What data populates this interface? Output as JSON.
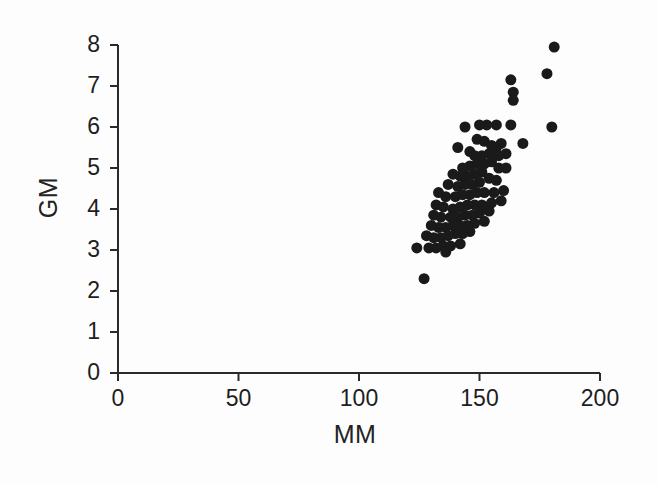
{
  "chart_data": {
    "type": "scatter",
    "title": "",
    "xlabel": "MM",
    "ylabel": "GM",
    "xlim": [
      0,
      200
    ],
    "ylim": [
      0,
      8
    ],
    "xticks": [
      0,
      50,
      100,
      150,
      200
    ],
    "yticks": [
      0,
      1,
      2,
      3,
      4,
      5,
      6,
      7,
      8
    ],
    "xtick_labels": [
      "0",
      "50",
      "100",
      "150",
      "200"
    ],
    "ytick_labels": [
      "0",
      "1",
      "2",
      "3",
      "4",
      "5",
      "6",
      "7",
      "8"
    ],
    "grid": false,
    "legend": null,
    "marker": "filled-circle",
    "marker_color": "#1a1a1a",
    "marker_size_px": 11,
    "n_points": 92,
    "points": [
      [
        181,
        7.95
      ],
      [
        178,
        7.3
      ],
      [
        163,
        7.15
      ],
      [
        164,
        6.85
      ],
      [
        164,
        6.65
      ],
      [
        180,
        6.0
      ],
      [
        163,
        6.05
      ],
      [
        157,
        6.05
      ],
      [
        153,
        6.05
      ],
      [
        150,
        6.05
      ],
      [
        144,
        6.0
      ],
      [
        168,
        5.6
      ],
      [
        159,
        5.6
      ],
      [
        149,
        5.7
      ],
      [
        152,
        5.65
      ],
      [
        155,
        5.55
      ],
      [
        157,
        5.5
      ],
      [
        161,
        5.35
      ],
      [
        158,
        5.3
      ],
      [
        154,
        5.35
      ],
      [
        151,
        5.3
      ],
      [
        148,
        5.3
      ],
      [
        146,
        5.4
      ],
      [
        141,
        5.5
      ],
      [
        155,
        5.15
      ],
      [
        152,
        5.1
      ],
      [
        149,
        5.1
      ],
      [
        146,
        5.05
      ],
      [
        143,
        5.0
      ],
      [
        158,
        5.0
      ],
      [
        161,
        5.0
      ],
      [
        151,
        4.9
      ],
      [
        148,
        4.85
      ],
      [
        145,
        4.8
      ],
      [
        142,
        4.8
      ],
      [
        139,
        4.85
      ],
      [
        154,
        4.75
      ],
      [
        157,
        4.7
      ],
      [
        150,
        4.65
      ],
      [
        147,
        4.6
      ],
      [
        144,
        4.6
      ],
      [
        141,
        4.55
      ],
      [
        137,
        4.6
      ],
      [
        160,
        4.45
      ],
      [
        156,
        4.4
      ],
      [
        152,
        4.4
      ],
      [
        149,
        4.4
      ],
      [
        146,
        4.35
      ],
      [
        143,
        4.35
      ],
      [
        140,
        4.3
      ],
      [
        136,
        4.3
      ],
      [
        133,
        4.4
      ],
      [
        159,
        4.2
      ],
      [
        155,
        4.15
      ],
      [
        151,
        4.1
      ],
      [
        148,
        4.1
      ],
      [
        145,
        4.1
      ],
      [
        142,
        4.05
      ],
      [
        139,
        4.0
      ],
      [
        135,
        4.05
      ],
      [
        132,
        4.1
      ],
      [
        154,
        3.95
      ],
      [
        150,
        3.9
      ],
      [
        147,
        3.85
      ],
      [
        144,
        3.85
      ],
      [
        141,
        3.8
      ],
      [
        138,
        3.8
      ],
      [
        134,
        3.8
      ],
      [
        131,
        3.85
      ],
      [
        152,
        3.7
      ],
      [
        148,
        3.65
      ],
      [
        145,
        3.6
      ],
      [
        142,
        3.6
      ],
      [
        139,
        3.6
      ],
      [
        136,
        3.55
      ],
      [
        133,
        3.55
      ],
      [
        130,
        3.6
      ],
      [
        146,
        3.45
      ],
      [
        143,
        3.4
      ],
      [
        140,
        3.4
      ],
      [
        137,
        3.35
      ],
      [
        134,
        3.3
      ],
      [
        131,
        3.3
      ],
      [
        128,
        3.35
      ],
      [
        142,
        3.15
      ],
      [
        138,
        3.1
      ],
      [
        135,
        3.1
      ],
      [
        132,
        3.05
      ],
      [
        129,
        3.05
      ],
      [
        124,
        3.05
      ],
      [
        136,
        2.95
      ],
      [
        127,
        2.3
      ]
    ]
  },
  "labels": {
    "x_axis_title": "MM",
    "y_axis_title": "GM"
  },
  "geometry": {
    "origin_x_px": 118,
    "origin_y_px": 373,
    "x_max_px": 600,
    "y_top_px": 45
  }
}
